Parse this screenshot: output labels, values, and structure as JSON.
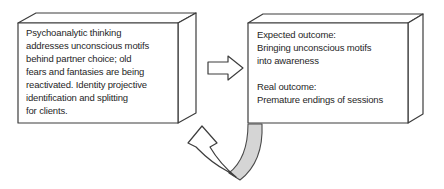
{
  "diagram": {
    "left_box": {
      "text": "Psychoanalytic thinking\naddresses unconscious motifs\nbehind partner choice; old\nfears and fantasies are being\nreactivated. Identity projective\nidentification and splitting\nfor clients."
    },
    "right_box": {
      "text": "Expected outcome:\nBringing unconscious motifs\ninto awareness\n\nReal outcome:\nPremature endings of sessions"
    },
    "arrows": {
      "forward_arrow": "right-block-arrow",
      "feedback_arrow": "curved-u-turn-arrow"
    },
    "colors": {
      "background": "#ffffff",
      "outline": "#3d3d3d",
      "text": "#1f1f1f",
      "shape_fill": "#ffffff",
      "feedback_band_fill": "#d5d5d5"
    }
  }
}
